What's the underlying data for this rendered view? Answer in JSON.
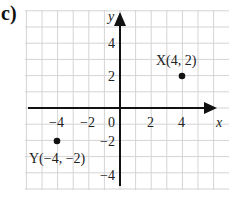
{
  "part_label": "c)",
  "axes": {
    "x_label": "x",
    "y_label": "y",
    "x_ticks": [
      "-4",
      "-2",
      "0",
      "2",
      "4"
    ],
    "y_ticks": [
      "4",
      "2",
      "-2",
      "-4"
    ]
  },
  "points": [
    {
      "name": "X",
      "x": 4,
      "y": 2,
      "label": "X(4, 2)"
    },
    {
      "name": "Y",
      "x": -4,
      "y": -2,
      "label": "Y(−4, −2)"
    }
  ],
  "chart_data": {
    "type": "scatter",
    "title": "",
    "xlabel": "x",
    "ylabel": "y",
    "xlim": [
      -6,
      6
    ],
    "ylim": [
      -5,
      5
    ],
    "grid": true,
    "x_tick_labels": [
      -4,
      -2,
      0,
      2,
      4
    ],
    "y_tick_labels": [
      4,
      2,
      -2,
      -4
    ],
    "series": [
      {
        "name": "points",
        "x": [
          4,
          -4
        ],
        "y": [
          2,
          -2
        ],
        "labels": [
          "X(4, 2)",
          "Y(−4, −2)"
        ]
      }
    ]
  }
}
